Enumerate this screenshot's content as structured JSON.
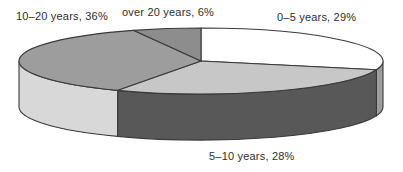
{
  "chart_data": {
    "type": "pie",
    "style": "3d",
    "title": "",
    "unit": "%",
    "legend": "none",
    "direction": "clockwise",
    "start_angle_deg": 0,
    "categories": [
      "0–5 years",
      "5–10 years",
      "10–20 years",
      "over 20 years"
    ],
    "values": [
      29,
      28,
      36,
      6
    ],
    "slices": [
      {
        "label": "0–5 years",
        "value": 29,
        "label_text": "0–5 years, 29%",
        "top_color": "#ffffff",
        "side_color": "#9c9c9c"
      },
      {
        "label": "5–10 years",
        "value": 28,
        "label_text": "5–10 years, 28%",
        "top_color": "#c7c7c7",
        "side_color": "#585858"
      },
      {
        "label": "10–20 years",
        "value": 36,
        "label_text": "10–20 years, 36%",
        "top_color": "#9d9d9d",
        "side_color": "#d8d8d8"
      },
      {
        "label": "over 20 years",
        "value": 6,
        "label_text": "over 20 years, 6%",
        "top_color": "#8d8d8d",
        "side_color": "#6f6f6f"
      }
    ],
    "labels_layout": [
      {
        "slice": 2,
        "x": 16,
        "y": 10
      },
      {
        "slice": 3,
        "x": 122,
        "y": 6
      },
      {
        "slice": 0,
        "x": 277,
        "y": 11
      },
      {
        "slice": 1,
        "x": 209,
        "y": 150
      }
    ],
    "geometry": {
      "cx": 201,
      "cy": 61,
      "rx": 182,
      "ry": 33,
      "depth": 46,
      "side_visible_from_deg": 90,
      "side_visible_to_deg": 270
    },
    "stroke_color": "#3a3a3a",
    "stroke_width": 1.1,
    "background": "#ffffff",
    "text_color": "#2e2e2e"
  }
}
